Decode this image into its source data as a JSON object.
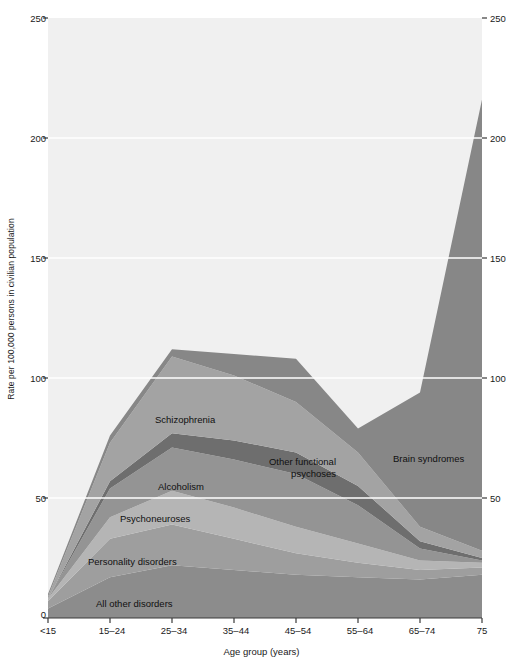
{
  "chart_data": {
    "type": "area",
    "title": "",
    "subtitle": "",
    "xlabel": "Age group (years)",
    "ylabel": "Rate per 100,000 persons in civilian population",
    "ylabel_right": "Rate per 100,000 persons in civilian population",
    "categories": [
      "<15",
      "15–24",
      "25–34",
      "35–44",
      "45–54",
      "55–64",
      "65–74",
      "75"
    ],
    "x_tick_labels": [
      "<15",
      "15–24",
      "25–34",
      "35–44",
      "45–54",
      "55–64",
      "65–74",
      "75"
    ],
    "y_tick_labels": [
      "0",
      "50",
      "100",
      "150",
      "200",
      "250"
    ],
    "y_ticks": [
      0,
      50,
      100,
      150,
      200,
      250
    ],
    "ylim": [
      0,
      250
    ],
    "grid": "horizontal white gridlines at 50, 100, 150, 200",
    "legend_position": "inline area labels",
    "stacked": true,
    "stack_order": "bottom to top",
    "series": [
      {
        "name": "All other disorders",
        "color": "#8c8c8c",
        "values": [
          4,
          17,
          22,
          20,
          18,
          17,
          16,
          18
        ]
      },
      {
        "name": "Personality disorders",
        "color": "#9e9e9e",
        "values": [
          3,
          16,
          17,
          13,
          9,
          6,
          4,
          3
        ]
      },
      {
        "name": "Psychoneuroses",
        "color": "#b5b5b5",
        "values": [
          1,
          9,
          14,
          13,
          11,
          8,
          4,
          2
        ]
      },
      {
        "name": "Alcoholism",
        "color": "#949494",
        "values": [
          0,
          12,
          18,
          20,
          22,
          16,
          5,
          1
        ]
      },
      {
        "name": "Other functional psychoses",
        "color": "#6e6e6e",
        "values": [
          0,
          3,
          6,
          8,
          9,
          8,
          3,
          1
        ]
      },
      {
        "name": "Schizophrenia",
        "color": "#a3a3a3",
        "values": [
          1,
          16,
          32,
          27,
          21,
          14,
          6,
          3
        ]
      },
      {
        "name": "Brain syndromes",
        "color": "#878787",
        "values": [
          1,
          3,
          3,
          9,
          18,
          10,
          56,
          188
        ]
      }
    ],
    "totals": [
      10,
      76,
      112,
      110,
      108,
      79,
      94,
      216
    ]
  },
  "axis": {
    "left_label": "Rate per 100,000 persons in civilian population",
    "x_title": "Age group (years)",
    "left_ticks": [
      "250",
      "200",
      "150",
      "100",
      "50",
      "0"
    ],
    "right_ticks": [
      "250",
      "200",
      "150",
      "100",
      "50"
    ]
  },
  "area_labels": [
    {
      "text": "Schizophrenia",
      "series": "Schizophrenia"
    },
    {
      "text": "Other functional\npsychoses",
      "series": "Other functional psychoses"
    },
    {
      "text": "Alcoholism",
      "series": "Alcoholism"
    },
    {
      "text": "Psychoneuroses",
      "series": "Psychoneuroses"
    },
    {
      "text": "Personality disorders",
      "series": "Personality disorders"
    },
    {
      "text": "All other disorders",
      "series": "All other disorders"
    },
    {
      "text": "Brain syndromes",
      "series": "Brain syndromes"
    }
  ],
  "colors": {
    "plot_background": "#f0f0f0",
    "gridline": "#ffffff",
    "axis_line": "#3a3a3a",
    "text": "#1a1a1a",
    "all_other_disorders": "#8c8c8c",
    "personality_disorders": "#9e9e9e",
    "psychoneuroses": "#b5b5b5",
    "alcoholism": "#949494",
    "other_functional_psychoses": "#6e6e6e",
    "schizophrenia": "#a3a3a3",
    "brain_syndromes": "#878787"
  }
}
